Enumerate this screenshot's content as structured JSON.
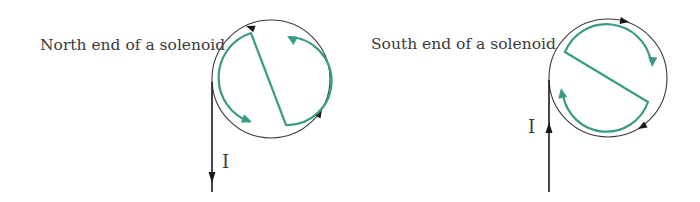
{
  "colors": {
    "background": "#ffffff",
    "text": "#3a3a3a",
    "wire": "#1a1a1a",
    "letter": "#3a9a85"
  },
  "diagrams": [
    {
      "id": "north",
      "caption": "North end of a solenoid",
      "current_label": "I",
      "current_direction": "down",
      "loop_direction": "counter-clockwise",
      "letter": "N",
      "caption_pos": {
        "x": 40,
        "y": 50
      },
      "current_label_pos": {
        "x": 222,
        "y": 168
      },
      "circle": {
        "cx": 271,
        "cy": 79,
        "r": 59
      },
      "wire": {
        "x": 212,
        "y1": 82,
        "y2": 192
      },
      "wire_arrow": {
        "x": 212,
        "tip_y": 183,
        "dir": "down"
      },
      "loop_arrows": [
        {
          "x": 246,
          "y": 26,
          "angle": 200
        },
        {
          "x": 322,
          "y": 109,
          "angle": -60
        }
      ],
      "letter_path": "M 250 122 A 47 47 0 0 1 251 33 L 286 125 A 44 44 0 0 0 289 37",
      "letter_arrows": [
        {
          "x": 250,
          "y": 122,
          "angle": 25
        },
        {
          "x": 289,
          "y": 37,
          "angle": 215
        }
      ]
    },
    {
      "id": "south",
      "caption": "South end of a solenoid",
      "current_label": "I",
      "current_direction": "up",
      "loop_direction": "clockwise",
      "letter": "S",
      "caption_pos": {
        "x": 371,
        "y": 49
      },
      "current_label_pos": {
        "x": 528,
        "y": 133
      },
      "circle": {
        "cx": 608,
        "cy": 78,
        "r": 59
      },
      "wire": {
        "x": 549,
        "y1": 80,
        "y2": 192
      },
      "wire_arrow": {
        "x": 549,
        "tip_y": 122,
        "dir": "up"
      },
      "loop_arrows": [
        {
          "x": 628,
          "y": 22,
          "angle": 10
        },
        {
          "x": 640,
          "y": 128,
          "angle": 150
        }
      ],
      "letter_path": "M 652 66 A 45 45 0 0 0 565 52 L 648 102 A 44 44 0 0 1 562 92",
      "letter_arrows": [
        {
          "x": 652,
          "y": 66,
          "angle": 95
        },
        {
          "x": 562,
          "y": 91,
          "angle": -95
        }
      ]
    }
  ]
}
